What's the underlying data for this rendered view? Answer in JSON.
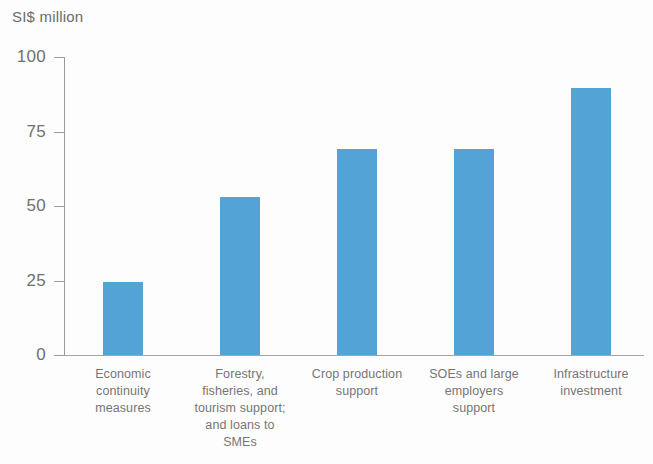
{
  "chart_data": {
    "type": "bar",
    "title": "",
    "subtitle": "",
    "xlabel": "",
    "ylabel": "SI$ million",
    "ylim": [
      0,
      100
    ],
    "yticks": [
      "0",
      "25",
      "50",
      "75",
      "100"
    ],
    "ytick_values": [
      0,
      25,
      50,
      75,
      100
    ],
    "grid": false,
    "legend": false,
    "legend_position": "none",
    "bar_color": "#53a3d6",
    "categories": [
      "Economic continuity measures",
      "Forestry, fisheries, and tourism support; and loans to SMEs",
      "Crop production support",
      "SOEs and large employers support",
      "Infrastructure investment"
    ],
    "category_lines": [
      [
        "Economic",
        "continuity",
        "measures"
      ],
      [
        "Forestry,",
        "fisheries, and",
        "tourism support;",
        "and loans to",
        "SMEs"
      ],
      [
        "Crop production",
        "support"
      ],
      [
        "SOEs and large",
        "employers",
        "support"
      ],
      [
        "Infrastructure",
        "investment"
      ]
    ],
    "values": [
      24.5,
      53,
      69,
      69,
      89.5
    ]
  }
}
